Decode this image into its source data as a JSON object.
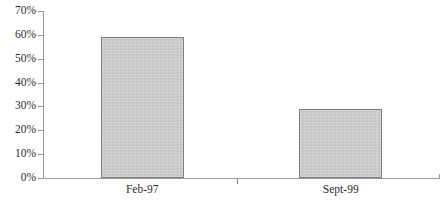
{
  "chart_data": {
    "type": "bar",
    "title": "",
    "subtitle": "",
    "xlabel": "",
    "ylabel": "",
    "categories": [
      "Feb-97",
      "Sept-99"
    ],
    "values": [
      59,
      29
    ],
    "series": [
      {
        "name": "",
        "values": [
          59,
          29
        ]
      }
    ],
    "ylim": [
      0,
      70
    ],
    "ytick_values": [
      0,
      10,
      20,
      30,
      40,
      50,
      60,
      70
    ],
    "ytick_labels": [
      "0%",
      "10%",
      "20%",
      "30%",
      "40%",
      "50%",
      "60%",
      "70%"
    ],
    "grid": false,
    "legend": false,
    "legend_position": "none",
    "annotations": [],
    "value_format": "percent"
  },
  "style": {
    "bar_fill": "#cacaca",
    "bar_border": "#7e7e7e",
    "axis_color": "#9a9a9a",
    "text_color": "#2b2b2b",
    "background": "#ffffff"
  }
}
